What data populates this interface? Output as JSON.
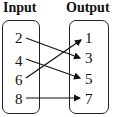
{
  "headers": {
    "input": "Input",
    "output": "Output"
  },
  "inputs": [
    "2",
    "4",
    "6",
    "8"
  ],
  "outputs": [
    "1",
    "3",
    "5",
    "7"
  ],
  "mappings": [
    {
      "from": "2",
      "to": "3"
    },
    {
      "from": "4",
      "to": "5"
    },
    {
      "from": "6",
      "to": "1"
    },
    {
      "from": "8",
      "to": "7"
    }
  ]
}
